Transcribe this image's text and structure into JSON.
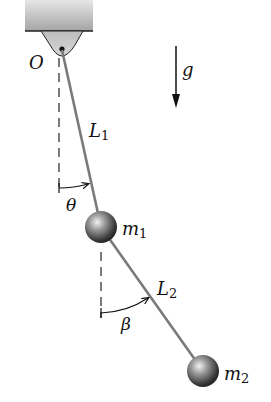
{
  "diagram": {
    "labels": {
      "pivot": "O",
      "gravity": "g",
      "length1_base": "L",
      "length1_sub": "1",
      "length2_base": "L",
      "length2_sub": "2",
      "angle1": "θ",
      "angle2": "β",
      "mass1_base": "m",
      "mass1_sub": "1",
      "mass2_base": "m",
      "mass2_sub": "2"
    },
    "geometry": {
      "pivot": [
        62,
        50
      ],
      "mass1_center": [
        101,
        227
      ],
      "mass2_center": [
        203,
        371
      ],
      "mass_radius": 16
    },
    "colors": {
      "rod": "#7a7a7a",
      "ceiling_top": "#d9d9d9",
      "ceiling_bottom": "#a8a8a8",
      "sphere_light": "#e8e8e8",
      "sphere_dark": "#2a2a2a",
      "ink": "#111111"
    }
  }
}
